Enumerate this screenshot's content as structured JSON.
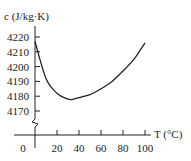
{
  "chart_data": {
    "type": "line",
    "title": "",
    "xlabel": "T (°C)",
    "ylabel": "c (J/kg·K)",
    "x_ticks": [
      0,
      20,
      40,
      60,
      80,
      100
    ],
    "y_ticks": [
      4170,
      4180,
      4190,
      4200,
      4210,
      4220
    ],
    "xlim": [
      0,
      100
    ],
    "ylim": [
      4170,
      4220
    ],
    "axis_break_on_y": true,
    "grid": false,
    "series": [
      {
        "name": "specific heat of water",
        "x": [
          0,
          10,
          20,
          30,
          35,
          40,
          50,
          60,
          70,
          80,
          90,
          100
        ],
        "y": [
          4217,
          4192,
          4182,
          4178,
          4178,
          4179,
          4181,
          4185,
          4190,
          4197,
          4205,
          4216
        ]
      }
    ]
  },
  "labels": {
    "ylabel": "c (J/kg·K)",
    "xlabel": "T (°C)",
    "x_ticks": [
      "0",
      "20",
      "40",
      "60",
      "80",
      "100"
    ],
    "y_ticks": [
      "4220",
      "4210",
      "4200",
      "4190",
      "4180",
      "4170"
    ]
  }
}
